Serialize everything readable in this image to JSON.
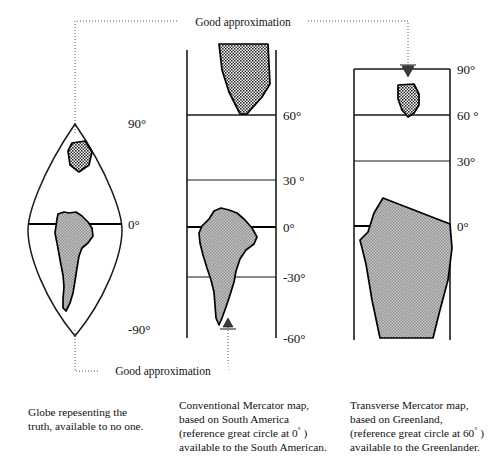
{
  "figure": {
    "title_annotations": [
      {
        "id": "top",
        "label": "Good approximation"
      },
      {
        "id": "bottom",
        "label": "Good approximation"
      }
    ],
    "panels": [
      {
        "id": "globe",
        "name": "globe-panel",
        "type": "globe-gore",
        "axis_labels": [
          "90°",
          "0°",
          "-90°"
        ],
        "landmasses": [
          {
            "name": "greenland",
            "fill": "#8a8a8a",
            "pattern": "checker-dark"
          },
          {
            "name": "south-america",
            "fill": "#9e9e9e",
            "pattern": "checker-light"
          }
        ],
        "caption_lines": [
          "Globe repesenting the",
          "truth, available to no one."
        ]
      },
      {
        "id": "conventional-mercator",
        "name": "conventional-mercator-panel",
        "type": "mercator",
        "axis_labels": [
          "60°",
          "30 °",
          "0°",
          "-30°",
          "-60°"
        ],
        "landmasses": [
          {
            "name": "greenland",
            "fill": "#8a8a8a",
            "pattern": "checker-dark"
          },
          {
            "name": "south-america",
            "fill": "#9e9e9e",
            "pattern": "checker-light"
          }
        ],
        "caption_lines": [
          "Conventional Mercator map,",
          "based on South America",
          "(reference great circle at 0° )",
          "available to the South American."
        ],
        "caption_ref_prefix": "(reference great circle at ",
        "caption_ref_value": "0",
        "caption_ref_suffix": " )"
      },
      {
        "id": "transverse-mercator",
        "name": "transverse-mercator-panel",
        "type": "mercator",
        "axis_labels": [
          "90°",
          "60 °",
          "30°",
          "0°"
        ],
        "landmasses": [
          {
            "name": "greenland",
            "fill": "#8a8a8a",
            "pattern": "checker-dark"
          },
          {
            "name": "south-america",
            "fill": "#9e9e9e",
            "pattern": "checker-light"
          }
        ],
        "caption_lines": [
          "Transverse Mercator map,",
          "based on Greenland,",
          "(reference great circle at 60° )",
          "available to the Greenlander."
        ],
        "caption_ref_prefix": "(reference great circle at ",
        "caption_ref_value": "60",
        "caption_ref_suffix": " )"
      }
    ],
    "colors": {
      "ink": "#111111",
      "land_dark": "#8a8a8a",
      "land_light": "#9e9e9e",
      "dotted": "#555555"
    }
  },
  "globe": {
    "label_north": "90°",
    "label_equator": "0°",
    "label_south": "-90°",
    "caption_line1": "Globe repesenting the",
    "caption_line2": "truth, available to no one."
  },
  "conventional": {
    "label_60": "60°",
    "label_30": "30 °",
    "label_0": "0°",
    "label_m30": "-30°",
    "label_m60": "-60°",
    "caption_line1": "Conventional Mercator map,",
    "caption_line2": "based on South America",
    "caption_line3_prefix": "(reference great circle at ",
    "caption_line3_value": "0",
    "caption_line3_suffix": " )",
    "caption_line4": "available to the South American."
  },
  "transverse": {
    "label_90": "90°",
    "label_60": "60 °",
    "label_30": "30°",
    "label_0": "0°",
    "caption_line1": "Transverse Mercator map,",
    "caption_line2": "based on Greenland,",
    "caption_line3_prefix": "(reference great circle at ",
    "caption_line3_value": "60",
    "caption_line3_suffix": " )",
    "caption_line4": "available to the Greenlander."
  },
  "annotations": {
    "top_label": "Good approximation",
    "bottom_label": "Good approximation"
  }
}
